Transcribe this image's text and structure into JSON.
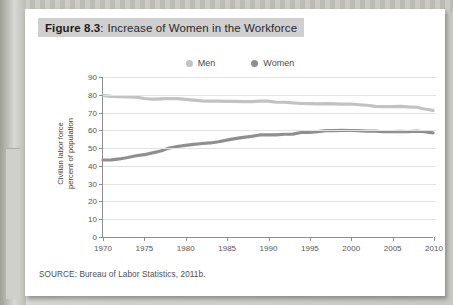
{
  "figure": {
    "number_label": "Figure 8.3",
    "colon": ":",
    "title": "Increase of Women in the Workforce",
    "source_note": "SOURCE: Bureau of Labor Statistics, 2011b."
  },
  "colors": {
    "men_line": "#c2c2c2",
    "women_line": "#8f8f8f",
    "axis": "#8e8e8e",
    "gridline": "#e2e2e2",
    "title_bar": "#cfcfcf",
    "card": "#ffffff",
    "backdrop": "#c9c9c6"
  },
  "chart_data": {
    "type": "line",
    "title": "Increase of Women in the Workforce",
    "xlabel": "",
    "ylabel": "Civilian labor force\npercent of population",
    "ylabel_line1": "Civilian labor force",
    "ylabel_line2": "percent of population",
    "xlim": [
      1970,
      2010
    ],
    "ylim": [
      0,
      90
    ],
    "yticks": [
      0,
      10,
      20,
      30,
      40,
      50,
      60,
      70,
      80,
      90
    ],
    "xticks": [
      1970,
      1975,
      1980,
      1985,
      1990,
      1995,
      2000,
      2005,
      2010
    ],
    "grid": true,
    "legend_position": "top-center",
    "x": [
      1970,
      1971,
      1972,
      1973,
      1974,
      1975,
      1976,
      1977,
      1978,
      1979,
      1980,
      1981,
      1982,
      1983,
      1984,
      1985,
      1986,
      1987,
      1988,
      1989,
      1990,
      1991,
      1992,
      1993,
      1994,
      1995,
      1996,
      1997,
      1998,
      1999,
      2000,
      2001,
      2002,
      2003,
      2004,
      2005,
      2006,
      2007,
      2008,
      2009,
      2010
    ],
    "series": [
      {
        "name": "Men",
        "color": "#c2c2c2",
        "values": [
          79.7,
          79.1,
          78.9,
          78.8,
          78.7,
          77.9,
          77.5,
          77.7,
          77.9,
          77.8,
          77.4,
          77.0,
          76.6,
          76.4,
          76.4,
          76.3,
          76.3,
          76.2,
          76.2,
          76.4,
          76.4,
          75.8,
          75.8,
          75.4,
          75.1,
          75.0,
          74.9,
          75.0,
          74.9,
          74.7,
          74.8,
          74.4,
          74.1,
          73.5,
          73.3,
          73.3,
          73.5,
          73.2,
          73.0,
          72.0,
          71.2
        ]
      },
      {
        "name": "Women",
        "color": "#8f8f8f",
        "values": [
          43.3,
          43.4,
          43.9,
          44.7,
          45.7,
          46.3,
          47.3,
          48.4,
          50.0,
          50.9,
          51.5,
          52.1,
          52.6,
          52.9,
          53.6,
          54.5,
          55.3,
          56.0,
          56.6,
          57.4,
          57.5,
          57.4,
          57.8,
          57.9,
          58.8,
          58.9,
          59.3,
          59.8,
          59.8,
          60.0,
          59.9,
          59.8,
          59.6,
          59.5,
          59.2,
          59.3,
          59.4,
          59.3,
          59.5,
          59.2,
          58.6
        ]
      }
    ]
  }
}
